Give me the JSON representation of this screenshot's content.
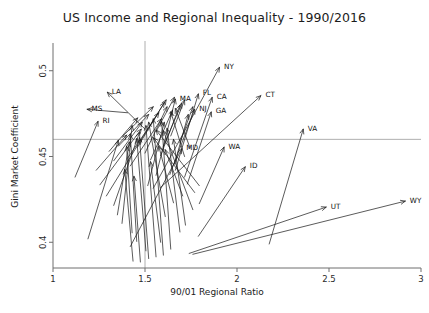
{
  "chart_data": {
    "type": "scatter",
    "title": "US Income and Regional Inequality - 1990/2016",
    "xlabel": "90/01 Regional Ratio",
    "ylabel": "Gini Market Coefficient",
    "xlim": [
      1,
      3
    ],
    "ylim": [
      0.385,
      0.515
    ],
    "xticks": [
      1,
      1.5,
      2,
      2.5,
      3
    ],
    "xtick_labels": [
      "1",
      "1.5",
      "2",
      "2.5",
      "3"
    ],
    "yticks": [
      0.4,
      0.45,
      0.5
    ],
    "ytick_labels": [
      "0.4",
      "0.45",
      "0.5"
    ],
    "grid": "reference lines at x=1.5 and y=0.46",
    "gridlines": {
      "vertical_x": 1.5,
      "horizontal_y": 0.46
    },
    "legend": "none",
    "annotation": "Each arrow runs from the 1990 value (tail) to the 2016 value (head); label marks the 2016 endpoint.",
    "series_name": "State change 1990 to 2016",
    "arrows": [
      {
        "label": "NY",
        "x_start": 1.545,
        "y_start": 0.4315,
        "x_end": 1.905,
        "y_end": 0.502
      },
      {
        "label": "CT",
        "x_start": 1.585,
        "y_start": 0.432,
        "x_end": 2.13,
        "y_end": 0.4855
      },
      {
        "label": "LA",
        "x_start": 1.5,
        "y_start": 0.466,
        "x_end": 1.295,
        "y_end": 0.4875
      },
      {
        "label": "MS",
        "x_start": 1.405,
        "y_start": 0.4755,
        "x_end": 1.185,
        "y_end": 0.4775
      },
      {
        "label": "RI",
        "x_start": 1.12,
        "y_start": 0.438,
        "x_end": 1.245,
        "y_end": 0.4705
      },
      {
        "label": "MA",
        "x_start": 1.56,
        "y_start": 0.439,
        "x_end": 1.665,
        "y_end": 0.4835
      },
      {
        "label": "FL",
        "x_start": 1.665,
        "y_start": 0.442,
        "x_end": 1.79,
        "y_end": 0.4865
      },
      {
        "label": "NJ",
        "x_start": 1.635,
        "y_start": 0.4395,
        "x_end": 1.77,
        "y_end": 0.4775
      },
      {
        "label": "CA",
        "x_start": 1.715,
        "y_start": 0.438,
        "x_end": 1.865,
        "y_end": 0.4845
      },
      {
        "label": "GA",
        "x_start": 1.73,
        "y_start": 0.434,
        "x_end": 1.86,
        "y_end": 0.476
      },
      {
        "label": "MD",
        "x_start": 1.42,
        "y_start": 0.3975,
        "x_end": 1.7,
        "y_end": 0.4545
      },
      {
        "label": "WA",
        "x_start": 1.795,
        "y_start": 0.4225,
        "x_end": 1.93,
        "y_end": 0.4555
      },
      {
        "label": "ID",
        "x_start": 1.79,
        "y_start": 0.4035,
        "x_end": 2.045,
        "y_end": 0.444
      },
      {
        "label": "VA",
        "x_start": 2.175,
        "y_start": 0.399,
        "x_end": 2.36,
        "y_end": 0.466
      },
      {
        "label": "UT",
        "x_start": 1.74,
        "y_start": 0.3935,
        "x_end": 2.485,
        "y_end": 0.4205
      },
      {
        "label": "WY",
        "x_start": 1.76,
        "y_start": 0.393,
        "x_end": 2.915,
        "y_end": 0.424
      },
      {
        "label": "",
        "x_start": 1.52,
        "y_start": 0.3905,
        "x_end": 1.47,
        "y_end": 0.461
      },
      {
        "label": "",
        "x_start": 1.56,
        "y_start": 0.3915,
        "x_end": 1.505,
        "y_end": 0.468
      },
      {
        "label": "",
        "x_start": 1.6,
        "y_start": 0.3925,
        "x_end": 1.545,
        "y_end": 0.472
      },
      {
        "label": "",
        "x_start": 1.64,
        "y_start": 0.396,
        "x_end": 1.59,
        "y_end": 0.4705
      },
      {
        "label": "",
        "x_start": 1.505,
        "y_start": 0.395,
        "x_end": 1.455,
        "y_end": 0.4605
      },
      {
        "label": "",
        "x_start": 1.455,
        "y_start": 0.4005,
        "x_end": 1.42,
        "y_end": 0.463
      },
      {
        "label": "",
        "x_start": 1.43,
        "y_start": 0.4055,
        "x_end": 1.4,
        "y_end": 0.456
      },
      {
        "label": "",
        "x_start": 1.69,
        "y_start": 0.406,
        "x_end": 1.62,
        "y_end": 0.4665
      },
      {
        "label": "",
        "x_start": 1.72,
        "y_start": 0.41,
        "x_end": 1.655,
        "y_end": 0.46
      },
      {
        "label": "",
        "x_start": 1.375,
        "y_start": 0.411,
        "x_end": 1.43,
        "y_end": 0.468
      },
      {
        "label": "",
        "x_start": 1.35,
        "y_start": 0.416,
        "x_end": 1.415,
        "y_end": 0.4585
      },
      {
        "label": "",
        "x_start": 1.61,
        "y_start": 0.415,
        "x_end": 1.52,
        "y_end": 0.47
      },
      {
        "label": "",
        "x_start": 1.33,
        "y_start": 0.4215,
        "x_end": 1.47,
        "y_end": 0.464
      },
      {
        "label": "",
        "x_start": 1.76,
        "y_start": 0.419,
        "x_end": 1.6,
        "y_end": 0.465
      },
      {
        "label": "",
        "x_start": 1.29,
        "y_start": 0.427,
        "x_end": 1.48,
        "y_end": 0.46
      },
      {
        "label": "",
        "x_start": 1.795,
        "y_start": 0.433,
        "x_end": 1.56,
        "y_end": 0.4655
      },
      {
        "label": "",
        "x_start": 1.77,
        "y_start": 0.429,
        "x_end": 1.545,
        "y_end": 0.461
      },
      {
        "label": "",
        "x_start": 1.255,
        "y_start": 0.4335,
        "x_end": 1.48,
        "y_end": 0.466
      },
      {
        "label": "",
        "x_start": 1.42,
        "y_start": 0.4445,
        "x_end": 1.59,
        "y_end": 0.472
      },
      {
        "label": "",
        "x_start": 1.405,
        "y_start": 0.449,
        "x_end": 1.575,
        "y_end": 0.4755
      },
      {
        "label": "",
        "x_start": 1.5,
        "y_start": 0.452,
        "x_end": 1.62,
        "y_end": 0.479
      },
      {
        "label": "",
        "x_start": 1.53,
        "y_start": 0.448,
        "x_end": 1.65,
        "y_end": 0.477
      },
      {
        "label": "",
        "x_start": 1.46,
        "y_start": 0.4555,
        "x_end": 1.605,
        "y_end": 0.4815
      },
      {
        "label": "",
        "x_start": 1.585,
        "y_start": 0.4505,
        "x_end": 1.69,
        "y_end": 0.48
      },
      {
        "label": "",
        "x_start": 1.355,
        "y_start": 0.456,
        "x_end": 1.52,
        "y_end": 0.4745
      },
      {
        "label": "",
        "x_start": 1.6,
        "y_start": 0.456,
        "x_end": 1.7,
        "y_end": 0.481
      },
      {
        "label": "",
        "x_start": 1.48,
        "y_start": 0.46,
        "x_end": 1.615,
        "y_end": 0.483
      },
      {
        "label": "",
        "x_start": 1.38,
        "y_start": 0.462,
        "x_end": 1.545,
        "y_end": 0.479
      },
      {
        "label": "",
        "x_start": 1.69,
        "y_start": 0.458,
        "x_end": 1.76,
        "y_end": 0.479
      },
      {
        "label": "",
        "x_start": 1.66,
        "y_start": 0.4455,
        "x_end": 1.735,
        "y_end": 0.4745
      },
      {
        "label": "",
        "x_start": 1.64,
        "y_start": 0.462,
        "x_end": 1.715,
        "y_end": 0.483
      },
      {
        "label": "",
        "x_start": 1.33,
        "y_start": 0.4475,
        "x_end": 1.485,
        "y_end": 0.47
      },
      {
        "label": "",
        "x_start": 1.305,
        "y_start": 0.453,
        "x_end": 1.46,
        "y_end": 0.4725
      },
      {
        "label": "",
        "x_start": 1.56,
        "y_start": 0.4645,
        "x_end": 1.66,
        "y_end": 0.4845
      },
      {
        "label": "",
        "x_start": 1.715,
        "y_start": 0.45,
        "x_end": 1.64,
        "y_end": 0.476
      },
      {
        "label": "",
        "x_start": 1.745,
        "y_start": 0.455,
        "x_end": 1.665,
        "y_end": 0.478
      },
      {
        "label": "",
        "x_start": 1.19,
        "y_start": 0.402,
        "x_end": 1.355,
        "y_end": 0.4595
      },
      {
        "label": "",
        "x_start": 1.435,
        "y_start": 0.389,
        "x_end": 1.39,
        "y_end": 0.4425
      },
      {
        "label": "",
        "x_start": 1.475,
        "y_start": 0.3885,
        "x_end": 1.44,
        "y_end": 0.4385
      },
      {
        "label": "",
        "x_start": 1.585,
        "y_start": 0.4,
        "x_end": 1.53,
        "y_end": 0.447
      },
      {
        "label": "",
        "x_start": 1.655,
        "y_start": 0.423,
        "x_end": 1.575,
        "y_end": 0.456
      },
      {
        "label": "",
        "x_start": 1.705,
        "y_start": 0.427,
        "x_end": 1.61,
        "y_end": 0.454
      },
      {
        "label": "",
        "x_start": 1.235,
        "y_start": 0.442,
        "x_end": 1.4,
        "y_end": 0.4625
      },
      {
        "label": "",
        "x_start": 1.515,
        "y_start": 0.433,
        "x_end": 1.605,
        "y_end": 0.47
      }
    ]
  }
}
